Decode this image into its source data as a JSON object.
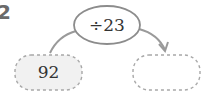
{
  "problem_number": "2",
  "operator_bubble": {
    "label": "÷23"
  },
  "input_box": {
    "value": "92"
  },
  "output_box": {
    "value": ""
  },
  "colors": {
    "stroke": "#9a9a9a",
    "dashed": "#a8a8a8",
    "input_fill": "#f1f1f1",
    "text": "#333333"
  }
}
